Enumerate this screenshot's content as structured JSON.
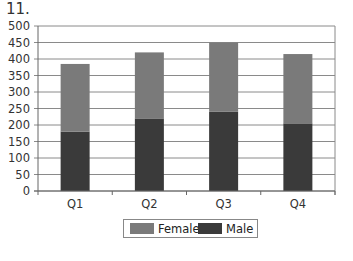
{
  "question_number": "11.",
  "chart_data": {
    "type": "bar",
    "stacked": true,
    "title": "",
    "xlabel": "",
    "ylabel": "",
    "categories": [
      "Q1",
      "Q2",
      "Q3",
      "Q4"
    ],
    "series": [
      {
        "name": "Male",
        "color": "#3a3a3a",
        "values": [
          180,
          220,
          240,
          205
        ]
      },
      {
        "name": "Female",
        "color": "#7a7a7a",
        "values": [
          205,
          200,
          210,
          210
        ]
      }
    ],
    "ylim": [
      0,
      500
    ],
    "yticks": [
      0,
      50,
      100,
      150,
      200,
      250,
      300,
      350,
      400,
      450,
      500
    ],
    "grid": true,
    "legend_position": "bottom",
    "legend": [
      "Female",
      "Male"
    ]
  },
  "legend": {
    "female_label": "Female",
    "male_label": "Male",
    "female_color": "#7a7a7a",
    "male_color": "#3a3a3a"
  }
}
